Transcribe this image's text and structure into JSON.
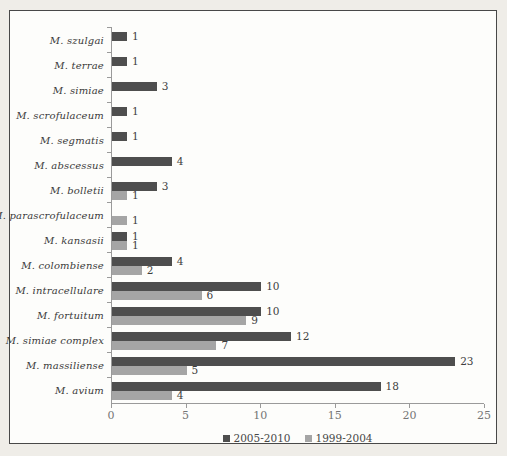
{
  "chart_data": {
    "type": "bar",
    "orientation": "horizontal",
    "title": "",
    "xlabel": "",
    "ylabel": "",
    "categories": [
      "M. szulgai",
      "M. terrae",
      "M. simiae",
      "M. scrofulaceum",
      "M. segmatis",
      "M. abscessus",
      "M. bolletii",
      "M. parascrofulaceum",
      "M. kansasii",
      "M. colombiense",
      "M. intracellulare",
      "M. fortuitum",
      "M. simiae complex",
      "M. massiliense",
      "M. avium"
    ],
    "series": [
      {
        "name": "2005-2010",
        "color": "#4e4e4e",
        "values": [
          1,
          1,
          3,
          1,
          1,
          4,
          3,
          null,
          1,
          4,
          10,
          10,
          12,
          23,
          18
        ]
      },
      {
        "name": "1999-2004",
        "color": "#a5a5a5",
        "values": [
          null,
          null,
          null,
          null,
          null,
          null,
          1,
          1,
          1,
          2,
          6,
          9,
          7,
          5,
          4
        ]
      }
    ],
    "xlim": [
      0,
      25
    ],
    "x_ticks": [
      "0",
      "5",
      "10",
      "15",
      "20",
      "25"
    ],
    "value_labels": true,
    "grid": false,
    "legend_position": "bottom"
  },
  "colors": {
    "outer_background": "#efede8",
    "plot_background": "#fdfdfb",
    "frame_border": "#484848",
    "axis_line": "#9a9a9a",
    "axis_text": "#757575",
    "label_text": "#3a3a3a",
    "value_text": "#3e3e3e"
  }
}
